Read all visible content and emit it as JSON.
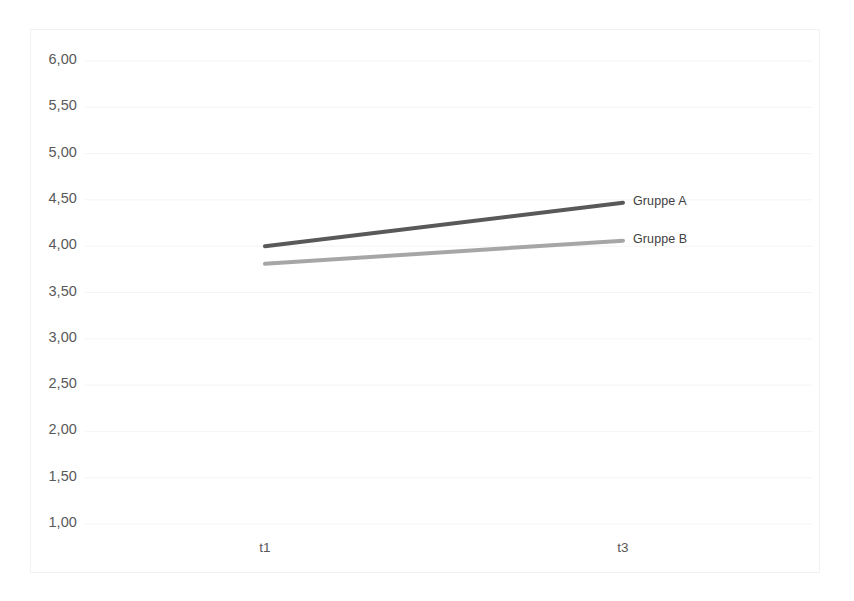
{
  "chart_data": {
    "type": "line",
    "title": "",
    "xlabel": "",
    "ylabel": "",
    "categories": [
      "t1",
      "t3"
    ],
    "x": [
      1,
      2
    ],
    "ylim": [
      1.0,
      6.0
    ],
    "ytick_step": 0.5,
    "ytick_labels": [
      "6,00",
      "5,50",
      "5,00",
      "4,50",
      "4,00",
      "3,50",
      "3,00",
      "2,50",
      "2,00",
      "1,50",
      "1,00"
    ],
    "ytick_values": [
      6.0,
      5.5,
      5.0,
      4.5,
      4.0,
      3.5,
      3.0,
      2.5,
      2.0,
      1.5,
      1.0
    ],
    "xtick_labels": [
      "t1",
      "t3"
    ],
    "grid": true,
    "grid_axis": "y",
    "legend_position": "inline-right",
    "series": [
      {
        "name": "Gruppe A",
        "values": [
          4.0,
          4.47
        ],
        "color": "#595959"
      },
      {
        "name": "Gruppe B",
        "values": [
          3.81,
          4.06
        ],
        "color": "#a6a6a6"
      }
    ]
  },
  "axis": {
    "y_labels": [
      {
        "text": "6,00",
        "value": 6.0
      },
      {
        "text": "5,50",
        "value": 5.5
      },
      {
        "text": "5,00",
        "value": 5.0
      },
      {
        "text": "4,50",
        "value": 4.5
      },
      {
        "text": "4,00",
        "value": 4.0
      },
      {
        "text": "3,50",
        "value": 3.5
      },
      {
        "text": "3,00",
        "value": 3.0
      },
      {
        "text": "2,50",
        "value": 2.5
      },
      {
        "text": "2,00",
        "value": 2.0
      },
      {
        "text": "1,50",
        "value": 1.5
      },
      {
        "text": "1,00",
        "value": 1.0
      }
    ],
    "x_labels": [
      {
        "text": "t1"
      },
      {
        "text": "t3"
      }
    ]
  },
  "legend": {
    "items": [
      {
        "label": "Gruppe A",
        "color": "#595959"
      },
      {
        "label": "Gruppe B",
        "color": "#a6a6a6"
      }
    ]
  },
  "colors": {
    "grid": "#f4f4f4",
    "frame": "#f2f2f2",
    "tick_text": "#595959",
    "legend_text": "#404040",
    "background": "#ffffff"
  }
}
